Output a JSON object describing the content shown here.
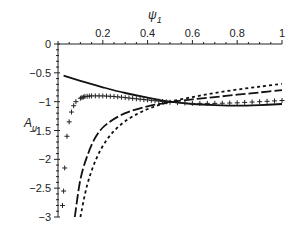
{
  "chart_data": {
    "type": "line",
    "title": "",
    "xlabel": "ψ1",
    "ylabel": "Au",
    "xlim": [
      0,
      1
    ],
    "ylim": [
      -3,
      0
    ],
    "grid": false,
    "legend": "none",
    "x_ticks": [
      "0.2",
      "0.4",
      "0.6",
      "0.8",
      "1"
    ],
    "y_ticks": [
      "0",
      "-0.5",
      "-1",
      "-1.5",
      "-2",
      "-2.5",
      "-3"
    ],
    "series": [
      {
        "name": "solid",
        "style": "solid",
        "x": [
          0.025,
          0.1,
          0.2,
          0.3,
          0.4,
          0.5,
          0.6,
          0.7,
          0.8,
          0.9,
          1.0
        ],
        "y": [
          -0.55,
          -0.64,
          -0.75,
          -0.85,
          -0.93,
          -1.0,
          -1.04,
          -1.06,
          -1.07,
          -1.06,
          -1.04
        ]
      },
      {
        "name": "plus-markers",
        "style": "plus",
        "x": [
          0.02,
          0.025,
          0.03,
          0.04,
          0.05,
          0.06,
          0.07,
          0.08,
          0.1,
          0.12,
          0.15,
          0.2,
          0.25,
          0.3,
          0.35,
          0.4,
          0.45,
          0.5,
          0.6,
          0.7,
          0.8,
          0.9,
          1.0
        ],
        "y": [
          -2.8,
          -2.55,
          -2.15,
          -1.6,
          -1.35,
          -1.18,
          -1.07,
          -1.0,
          -0.94,
          -0.91,
          -0.9,
          -0.9,
          -0.91,
          -0.93,
          -0.95,
          -0.97,
          -0.99,
          -1.01,
          -1.03,
          -1.03,
          -1.02,
          -1.0,
          -0.98
        ]
      },
      {
        "name": "long-dash",
        "style": "long-dash",
        "x": [
          0.075,
          0.1,
          0.13,
          0.17,
          0.22,
          0.3,
          0.4,
          0.5,
          0.6,
          0.7,
          0.8,
          0.9,
          1.0
        ],
        "y": [
          -3.0,
          -2.35,
          -1.95,
          -1.6,
          -1.38,
          -1.2,
          -1.08,
          -1.01,
          -0.96,
          -0.92,
          -0.88,
          -0.84,
          -0.8
        ]
      },
      {
        "name": "short-dash",
        "style": "short-dash",
        "x": [
          0.1,
          0.13,
          0.17,
          0.22,
          0.28,
          0.35,
          0.42,
          0.5,
          0.6,
          0.7,
          0.8,
          0.9,
          1.0
        ],
        "y": [
          -3.0,
          -2.45,
          -2.0,
          -1.65,
          -1.4,
          -1.22,
          -1.1,
          -1.0,
          -0.92,
          -0.85,
          -0.79,
          -0.74,
          -0.69
        ]
      }
    ]
  }
}
